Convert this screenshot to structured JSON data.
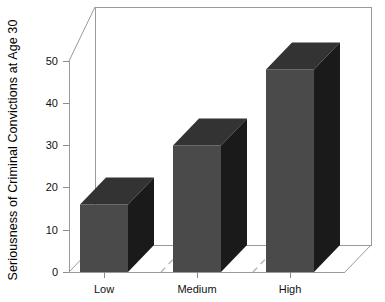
{
  "chart_data": {
    "type": "bar",
    "title": "",
    "subtitle": "",
    "xlabel": "",
    "ylabel": "Seriousness of Criminal Convictions at Age 30",
    "categories": [
      "Low",
      "Medium",
      "High"
    ],
    "values": [
      16,
      30,
      48
    ],
    "series": [
      {
        "name": "Seriousness of Criminal Convictions at Age 30",
        "values": [
          16,
          30,
          48
        ]
      }
    ],
    "ylim": [
      0,
      55
    ],
    "yticks": [
      0,
      10,
      20,
      30,
      40,
      50
    ],
    "ytick_labels": [
      "0",
      "10",
      "20",
      "30",
      "40",
      "50"
    ],
    "grid": false,
    "legend": false,
    "legend_position": "none",
    "projection": "3d-oblique",
    "annotations": [],
    "colors": {
      "bar_front": "#4a4a4a",
      "bar_top": "#333333",
      "bar_side": "#1a1a1a",
      "background": "#ffffff",
      "axis_line": "#9a9a9a",
      "tick_mark": "#8c8c8c",
      "separator": "#b5b5b5",
      "text": "#111111"
    }
  },
  "axes": {
    "y_title": "Seriousness of Criminal Convictions at Age 30",
    "ticks": [
      {
        "label": "50",
        "value": 50
      },
      {
        "label": "40",
        "value": 40
      },
      {
        "label": "30",
        "value": 30
      },
      {
        "label": "20",
        "value": 20
      },
      {
        "label": "10",
        "value": 10
      },
      {
        "label": "0",
        "value": 0
      }
    ],
    "categories": [
      {
        "label": "Low"
      },
      {
        "label": "Medium"
      },
      {
        "label": "High"
      }
    ]
  }
}
